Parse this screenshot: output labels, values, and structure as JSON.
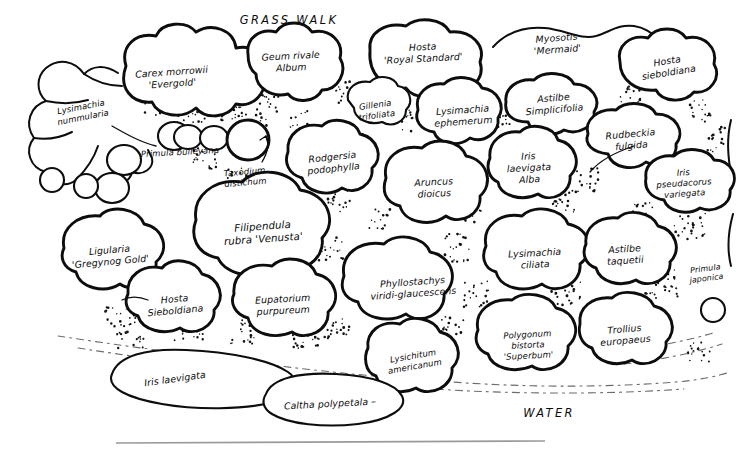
{
  "document": {
    "type": "hand-drawn garden planting plan",
    "title": "Waterside bed planting plan"
  },
  "annotations": {
    "grass_walk": "GRASS WALK",
    "water": "WATER"
  },
  "plants": [
    {
      "id": "lysimachia-nummularia",
      "lines": [
        "Lysimachia",
        "nummularia"
      ],
      "x": 82,
      "y": 112,
      "size": "sm",
      "rotate": -11,
      "inside": false
    },
    {
      "id": "carex-morrowii-evergold",
      "lines": [
        "Carex morrowii",
        "'Evergold'"
      ],
      "x": 172,
      "y": 78,
      "size": "",
      "rotate": -4,
      "inside": true
    },
    {
      "id": "geum-rivale-album",
      "lines": [
        "Geum rivale",
        "Album"
      ],
      "x": 291,
      "y": 62,
      "size": "",
      "rotate": -3,
      "inside": true
    },
    {
      "id": "hosta-royal-standard",
      "lines": [
        "Hosta",
        "'Royal Standard'"
      ],
      "x": 423,
      "y": 53,
      "size": "",
      "rotate": -3,
      "inside": true
    },
    {
      "id": "myosotis-mermaid",
      "lines": [
        "Myosotis",
        "'Mermaid'"
      ],
      "x": 557,
      "y": 44,
      "size": "",
      "rotate": -4,
      "inside": true
    },
    {
      "id": "hosta-sieboldiana-top",
      "lines": [
        "Hosta",
        "sieboldiana"
      ],
      "x": 668,
      "y": 67,
      "size": "",
      "rotate": -9,
      "inside": true
    },
    {
      "id": "gillenia-trifoliata",
      "lines": [
        "Gillenia",
        "trifoliata"
      ],
      "x": 376,
      "y": 110,
      "size": "sm",
      "rotate": -8,
      "inside": true
    },
    {
      "id": "lysimachia-ephemerum",
      "lines": [
        "Lysimachia",
        "ephemerum"
      ],
      "x": 463,
      "y": 116,
      "size": "",
      "rotate": -4,
      "inside": true
    },
    {
      "id": "astilbe-simplicifolia",
      "lines": [
        "Astilbe",
        "Simplicifolia"
      ],
      "x": 554,
      "y": 104,
      "size": "",
      "rotate": -5,
      "inside": true
    },
    {
      "id": "rudbeckia-fulgida",
      "lines": [
        "Rudbeckia",
        "fulgida"
      ],
      "x": 631,
      "y": 140,
      "size": "",
      "rotate": -5,
      "inside": true
    },
    {
      "id": "primula-bulleyana",
      "lines": [
        "Primula  bulleyana"
      ],
      "x": 180,
      "y": 152,
      "size": "sm",
      "rotate": -3,
      "inside": false
    },
    {
      "id": "taxodium-distichum",
      "lines": [
        "Taxodium",
        "distichum"
      ],
      "x": 245,
      "y": 177,
      "size": "sm",
      "rotate": -5,
      "inside": false
    },
    {
      "id": "rodgersia-podophylla",
      "lines": [
        "Rodgersia",
        "podophylla"
      ],
      "x": 333,
      "y": 163,
      "size": "",
      "rotate": -6,
      "inside": true
    },
    {
      "id": "aruncus-dioicus",
      "lines": [
        "Aruncus",
        "dioicus"
      ],
      "x": 434,
      "y": 188,
      "size": "",
      "rotate": -3,
      "inside": true
    },
    {
      "id": "iris-laevigata-alba",
      "lines": [
        "Iris",
        "laevigata",
        "Alba"
      ],
      "x": 529,
      "y": 168,
      "size": "",
      "rotate": -3,
      "inside": true
    },
    {
      "id": "iris-pseudacorus-variegata",
      "lines": [
        "Iris",
        "pseudacorus",
        "variegata"
      ],
      "x": 684,
      "y": 183,
      "size": "sm",
      "rotate": -4,
      "inside": true
    },
    {
      "id": "filipendula-rubra-venusta",
      "lines": [
        "Filipendula",
        "rubra 'Venusta'"
      ],
      "x": 263,
      "y": 233,
      "size": "lg",
      "rotate": -4,
      "inside": true
    },
    {
      "id": "ligularia-gregynog-gold",
      "lines": [
        "Ligularia",
        "'Gregynog Gold'"
      ],
      "x": 110,
      "y": 256,
      "size": "",
      "rotate": -5,
      "inside": true
    },
    {
      "id": "lysimachia-ciliata",
      "lines": [
        "Lysimachia",
        "ciliata"
      ],
      "x": 535,
      "y": 259,
      "size": "",
      "rotate": -3,
      "inside": true
    },
    {
      "id": "astilbe-taquetii",
      "lines": [
        "Astilbe",
        "taquetii"
      ],
      "x": 625,
      "y": 255,
      "size": "",
      "rotate": -4,
      "inside": true
    },
    {
      "id": "hosta-sieboldiana-lower",
      "lines": [
        "Hosta",
        "Sieboldiana"
      ],
      "x": 175,
      "y": 305,
      "size": "",
      "rotate": -5,
      "inside": true
    },
    {
      "id": "eupatorium-purpureum",
      "lines": [
        "Eupatorium",
        "purpureum"
      ],
      "x": 283,
      "y": 305,
      "size": "",
      "rotate": -3,
      "inside": true
    },
    {
      "id": "phyllostachys-viridi-glaucescens",
      "lines": [
        "Phyllostachys",
        "viridi-glaucescens"
      ],
      "x": 413,
      "y": 288,
      "size": "",
      "rotate": -4,
      "inside": true
    },
    {
      "id": "primula-japonica",
      "lines": [
        "Primula",
        "japonica"
      ],
      "x": 706,
      "y": 274,
      "size": "xs",
      "rotate": -7,
      "inside": false
    },
    {
      "id": "polygonum-bistorta-superbum",
      "lines": [
        "Polygonum",
        "bistorta",
        "'Superbum'"
      ],
      "x": 528,
      "y": 345,
      "size": "sm",
      "rotate": -3,
      "inside": true
    },
    {
      "id": "trollius-europaeus",
      "lines": [
        "Trollius",
        "europaeus"
      ],
      "x": 625,
      "y": 335,
      "size": "",
      "rotate": -5,
      "inside": true
    },
    {
      "id": "lysichitum-americanum",
      "lines": [
        "Lysichitum",
        "americanum"
      ],
      "x": 414,
      "y": 361,
      "size": "sm",
      "rotate": -10,
      "inside": true
    },
    {
      "id": "iris-laevigata",
      "lines": [
        "Iris laevigata"
      ],
      "x": 175,
      "y": 379,
      "size": "",
      "rotate": -8,
      "inside": true
    },
    {
      "id": "caltha-polypetala",
      "lines": [
        "Caltha polypetala  –"
      ],
      "x": 330,
      "y": 404,
      "size": "",
      "rotate": -3,
      "inside": true
    }
  ],
  "colors": {
    "ink": "#0d0d0d",
    "paper": "#ffffff",
    "rule": "#9a9a9a",
    "waterline": "#6b6b6b"
  }
}
